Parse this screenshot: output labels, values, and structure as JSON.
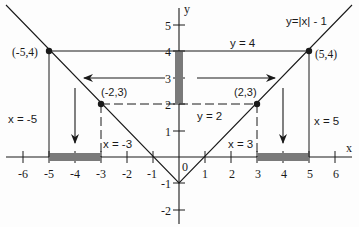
{
  "diagram": {
    "function_label": "y=|x| - 1",
    "axis_labels": {
      "x": "x",
      "y": "y",
      "origin": "0"
    },
    "x_ticks": [
      {
        "v": -6,
        "label": "-6"
      },
      {
        "v": -5,
        "label": "-5"
      },
      {
        "v": -4,
        "label": "-4"
      },
      {
        "v": -3,
        "label": "-3"
      },
      {
        "v": -2,
        "label": "-2"
      },
      {
        "v": -1,
        "label": "-1"
      },
      {
        "v": 1,
        "label": "1"
      },
      {
        "v": 2,
        "label": "2"
      },
      {
        "v": 3,
        "label": "3"
      },
      {
        "v": 4,
        "label": "4"
      },
      {
        "v": 5,
        "label": "5"
      },
      {
        "v": 6,
        "label": "6"
      }
    ],
    "y_ticks": [
      {
        "v": 5,
        "label": "5"
      },
      {
        "v": 4,
        "label": "4"
      },
      {
        "v": 3,
        "label": "3"
      },
      {
        "v": 2,
        "label": "2"
      },
      {
        "v": 1,
        "label": "1"
      },
      {
        "v": -1,
        "label": "-1"
      },
      {
        "v": -2,
        "label": "-2"
      }
    ],
    "points": [
      {
        "x": -5,
        "y": 4,
        "label": "(-5,4)"
      },
      {
        "x": -2,
        "y": 3,
        "label": "(-2,3)"
      },
      {
        "x": 2,
        "y": 3,
        "label": "(2,3)"
      },
      {
        "x": 5,
        "y": 4,
        "label": "(5,4)"
      }
    ],
    "line_labels": {
      "y4": "y = 4",
      "y2": "y = 2",
      "xm5": "x = -5",
      "xm3": "x = -3",
      "x3": "x = 3",
      "x5": "x = 5"
    },
    "shaded_intervals": {
      "y_range": [
        2,
        4
      ],
      "x_left": [
        -5,
        -3
      ],
      "x_right": [
        3,
        5
      ]
    },
    "colors": {
      "ink": "#1a1a1a",
      "shade": "#7a7a7a",
      "background": "#fdfdfd"
    }
  }
}
